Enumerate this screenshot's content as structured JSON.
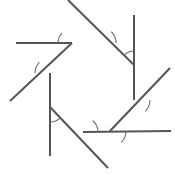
{
  "figure": {
    "canvas": {
      "width": 175,
      "height": 175,
      "background": "#ffffff"
    },
    "style": {
      "line_color": "#555555",
      "line_width": 2,
      "arc_color": "#6b6b6b",
      "arc_width": 1.1
    },
    "shape": {
      "name": "heptagon",
      "sides": 7,
      "vertices": [
        {
          "id": "v1",
          "label": "top-left",
          "x": 72,
          "y": 43
        },
        {
          "id": "v2",
          "label": "top-right",
          "x": 134,
          "y": 65
        },
        {
          "id": "v3",
          "label": "right",
          "x": 134,
          "y": 100
        },
        {
          "id": "v4",
          "label": "bottom-right",
          "x": 110,
          "y": 131
        },
        {
          "id": "v5",
          "label": "bottom",
          "x": 83,
          "y": 132
        },
        {
          "id": "v6",
          "label": "bottom-left",
          "x": 50,
          "y": 107
        },
        {
          "id": "v7",
          "label": "left",
          "x": 50,
          "y": 73
        }
      ]
    },
    "lines": [
      {
        "id": "L1",
        "name": "top-horizontal-side",
        "x1": 16,
        "y1": 43,
        "x2": 72,
        "y2": 43,
        "extends_past": "v1"
      },
      {
        "id": "L2",
        "name": "upper-right-descending-side",
        "x1": 68,
        "y1": 0,
        "x2": 134,
        "y2": 65,
        "extends_past": "v2"
      },
      {
        "id": "L3",
        "name": "right-vertical-side",
        "x1": 134,
        "y1": 15,
        "x2": 134,
        "y2": 100,
        "extends_past": "v3"
      },
      {
        "id": "L4",
        "name": "lower-right-ascending-side",
        "x1": 110,
        "y1": 131,
        "x2": 170,
        "y2": 68,
        "extends_past": "v4"
      },
      {
        "id": "L5",
        "name": "bottom-horizontal-side",
        "x1": 83,
        "y1": 132,
        "x2": 171,
        "y2": 131,
        "extends_past": "v5"
      },
      {
        "id": "L6",
        "name": "lower-left-descending-side",
        "x1": 50,
        "y1": 107,
        "x2": 108,
        "y2": 168,
        "extends_past": "v6"
      },
      {
        "id": "L7",
        "name": "left-vertical-side",
        "x1": 50,
        "y1": 73,
        "x2": 50,
        "y2": 156,
        "extends_past": "v7"
      },
      {
        "id": "L8",
        "name": "upper-left-descending-transversal",
        "x1": 10,
        "y1": 101,
        "x2": 72,
        "y2": 43,
        "extends_past": "v7"
      }
    ],
    "angle_marks": [
      {
        "id": "a1",
        "name": "exterior-angle-top-left",
        "cx": 72,
        "cy": 43,
        "r": 14,
        "start_deg": 135,
        "end_deg": 180
      },
      {
        "id": "a2",
        "name": "exterior-angle-top-center",
        "cx": 100,
        "cy": 43,
        "r": 16,
        "start_deg": 0,
        "end_deg": 45
      },
      {
        "id": "a3",
        "name": "exterior-angle-top-right",
        "cx": 134,
        "cy": 65,
        "r": 14,
        "start_deg": 90,
        "end_deg": 135
      },
      {
        "id": "a4",
        "name": "exterior-angle-right",
        "cx": 134,
        "cy": 100,
        "r": 16,
        "start_deg": 315,
        "end_deg": 360
      },
      {
        "id": "a5",
        "name": "exterior-angle-bottom-right",
        "cx": 110,
        "cy": 131,
        "r": 16,
        "start_deg": 315,
        "end_deg": 360
      },
      {
        "id": "a6",
        "name": "exterior-angle-bottom",
        "cx": 83,
        "cy": 132,
        "r": 15,
        "start_deg": 0,
        "end_deg": 50
      },
      {
        "id": "a7",
        "name": "exterior-angle-bottom-left",
        "cx": 50,
        "cy": 107,
        "r": 15,
        "start_deg": 270,
        "end_deg": 315
      },
      {
        "id": "a8",
        "name": "exterior-angle-left",
        "cx": 50,
        "cy": 73,
        "r": 15,
        "start_deg": 135,
        "end_deg": 180
      }
    ]
  }
}
